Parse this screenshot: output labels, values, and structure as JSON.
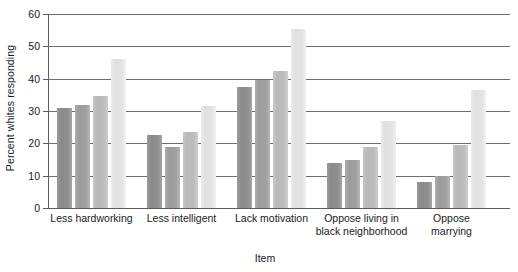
{
  "chart_data": {
    "type": "bar",
    "title": "",
    "xlabel": "Item",
    "ylabel": "Percent whites responding",
    "ylim": [
      0,
      60
    ],
    "yticks": [
      0,
      10,
      20,
      30,
      40,
      50,
      60
    ],
    "grid": true,
    "legend": "none",
    "categories": [
      "Less hardworking",
      "Less intelligent",
      "Lack motivation",
      "Oppose living in black neighborhood",
      "Oppose marrying"
    ],
    "category_lines": [
      [
        "Less hardworking"
      ],
      [
        "Less intelligent"
      ],
      [
        "Lack motivation"
      ],
      [
        "Oppose living in",
        "black neighborhood"
      ],
      [
        "Oppose",
        "marrying"
      ]
    ],
    "series": [
      {
        "name": "Series 1",
        "shade": "#8e8e8e",
        "values": [
          31,
          22.5,
          37.5,
          14,
          8
        ]
      },
      {
        "name": "Series 2",
        "shade": "#a0a0a0",
        "values": [
          31.8,
          18.8,
          39.5,
          15,
          10
        ]
      },
      {
        "name": "Series 3",
        "shade": "#bcbcbc",
        "values": [
          34.5,
          23.5,
          42.5,
          19,
          19.5
        ]
      },
      {
        "name": "Series 4",
        "shade": "#e3e3e3",
        "values": [
          46,
          31.5,
          55.5,
          27,
          36.5
        ]
      }
    ]
  },
  "axis": {
    "y_tick_labels": [
      "0",
      "10",
      "20",
      "30",
      "40",
      "50",
      "60"
    ],
    "y_title": "Percent whites responding",
    "x_title": "Item"
  }
}
